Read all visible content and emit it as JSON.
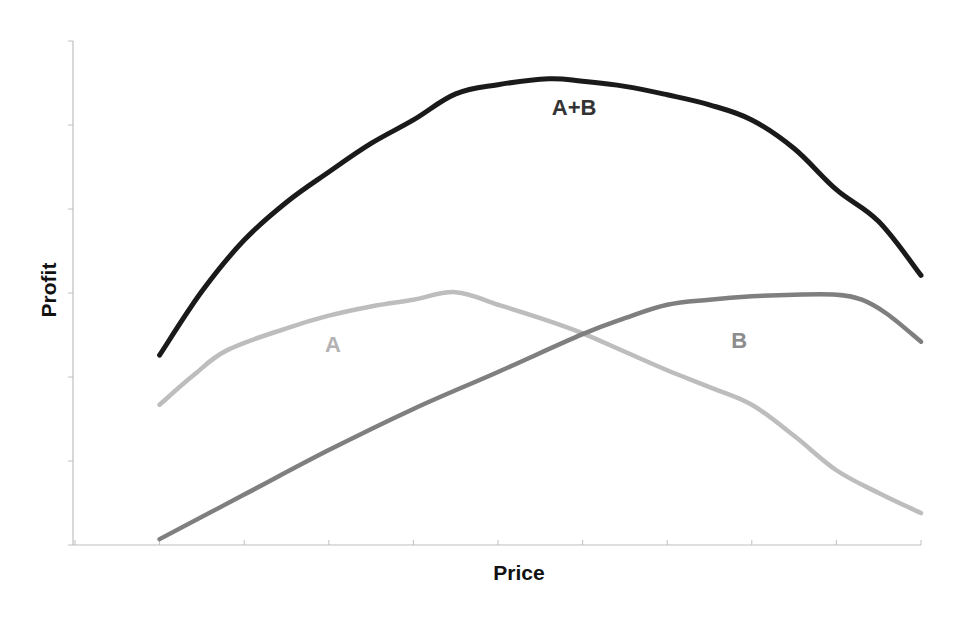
{
  "chart_data": {
    "type": "line",
    "title": "",
    "xlabel": "Price",
    "ylabel": "Profit",
    "xlim": [
      0,
      10
    ],
    "ylim": [
      0,
      6
    ],
    "x_ticks": [
      0,
      1,
      2,
      3,
      4,
      5,
      6,
      7,
      8,
      9,
      10
    ],
    "y_ticks": [
      0,
      1,
      2,
      3,
      4,
      5,
      6
    ],
    "tick_labels_visible": false,
    "grid": false,
    "legend": "inline labels",
    "series": [
      {
        "name": "A+B",
        "label": "A+B",
        "color": "#1a1a1a",
        "label_color": "#333333",
        "label_pos": [
          5.9,
          5.12
        ],
        "x": [
          1,
          1.5,
          2,
          2.5,
          3,
          3.5,
          4,
          4.5,
          5,
          5.6,
          6,
          6.5,
          7,
          7.5,
          8,
          8.5,
          9,
          9.5,
          10
        ],
        "values": [
          2.26,
          3.02,
          3.63,
          4.08,
          4.44,
          4.78,
          5.06,
          5.37,
          5.48,
          5.55,
          5.52,
          5.46,
          5.36,
          5.24,
          5.06,
          4.72,
          4.23,
          3.85,
          3.21
        ]
      },
      {
        "name": "A",
        "label": "A",
        "color": "#bdbdbd",
        "label_color": "#b3b3b3",
        "label_pos": [
          3.05,
          2.3
        ],
        "x": [
          1,
          1.4,
          1.8,
          2.5,
          3,
          3.5,
          4,
          4.5,
          5,
          5.5,
          6,
          6.5,
          7,
          7.5,
          8,
          8.5,
          9,
          9.5,
          10
        ],
        "values": [
          1.67,
          2.02,
          2.32,
          2.58,
          2.73,
          2.84,
          2.92,
          3.01,
          2.86,
          2.7,
          2.52,
          2.3,
          2.08,
          1.88,
          1.67,
          1.3,
          0.89,
          0.62,
          0.38
        ]
      },
      {
        "name": "B",
        "label": "B",
        "color": "#7f7f7f",
        "label_color": "#8c8c8c",
        "label_pos": [
          7.85,
          2.34
        ],
        "x": [
          1,
          2,
          3,
          4,
          5,
          6,
          6.5,
          7,
          7.5,
          8,
          8.5,
          9,
          9.3,
          9.6,
          10
        ],
        "values": [
          0.07,
          0.6,
          1.13,
          1.62,
          2.06,
          2.51,
          2.7,
          2.86,
          2.92,
          2.96,
          2.98,
          2.98,
          2.92,
          2.75,
          2.42
        ]
      }
    ]
  },
  "axes": {
    "x_title": "Price",
    "y_title": "Profit"
  }
}
